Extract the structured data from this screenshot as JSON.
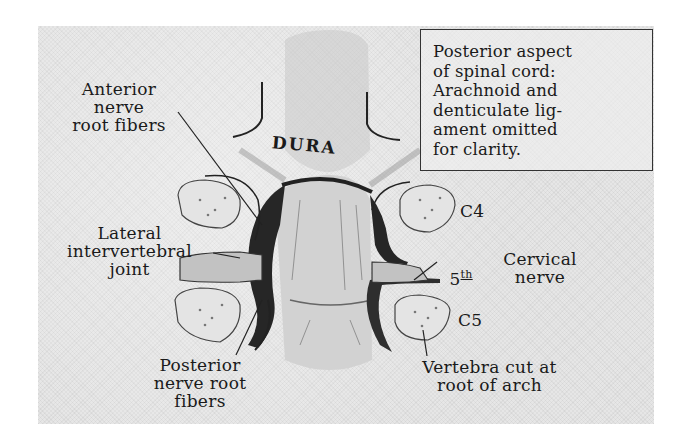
{
  "figure": {
    "note_box": {
      "lines": [
        "Posterior aspect",
        "of spinal cord:",
        "Arachnoid and",
        "denticulate lig-",
        "ament omitted",
        "for clarity."
      ]
    },
    "labels": {
      "dura": "DURA",
      "anterior_root": "Anterior\nnerve\nroot fibers",
      "lateral_joint": "Lateral\nintervertebral\njoint",
      "posterior_root": "Posterior\nnerve root\nfibers",
      "c4": "C4",
      "c5": "C5",
      "cervical_nerve_number": "5",
      "cervical_nerve_suffix": "th",
      "cervical_nerve_name": "Cervical\nnerve",
      "vertebra": "Vertebra cut at\nroot of arch"
    },
    "colors": {
      "background": "#e6e6e6",
      "ink": "#1a1a1a",
      "shadow": "#2b2b2b",
      "cord": "#cfcfcf"
    }
  }
}
